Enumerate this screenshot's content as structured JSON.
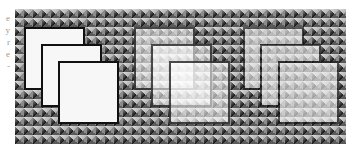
{
  "figure": {
    "margin_text_fragments": [
      "e",
      "y",
      "r",
      "e",
      "-"
    ],
    "background_pattern": "pyramid-studs",
    "colors": {
      "square_fill": "#f7f7f7",
      "square_border": "#111111",
      "pattern_dark": "#1c1c1c",
      "pattern_light": "#b8b8b8"
    },
    "groups": [
      {
        "name": "opaque",
        "squares": 3,
        "mode": "fully opaque"
      },
      {
        "name": "individual-opacity",
        "squares": 3,
        "mode": "each square semi-transparent, overlaps visible"
      },
      {
        "name": "group-opacity",
        "squares": 3,
        "mode": "group composited then made semi-transparent"
      }
    ]
  }
}
